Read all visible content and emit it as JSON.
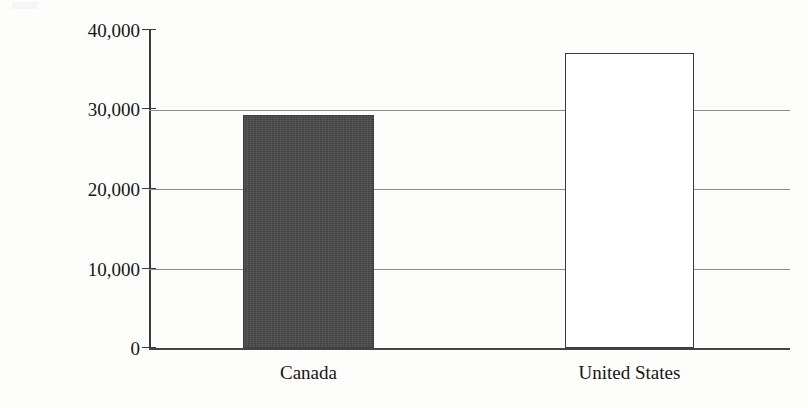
{
  "figure": {
    "background_color": "#fdfdfc",
    "y_axis_title": "income per capita in 1998 C$"
  },
  "chart_data": {
    "type": "bar",
    "title": "",
    "xlabel": "",
    "ylabel": "income per capita in 1998 C$",
    "categories": [
      "Canada",
      "United States"
    ],
    "values": [
      29300,
      37100
    ],
    "ylim": [
      0,
      40000
    ],
    "ytick_values": [
      0,
      10000,
      20000,
      30000,
      40000
    ],
    "ytick_labels": [
      "0",
      "10,000",
      "20,000",
      "30,000",
      "40,000"
    ],
    "grid": true,
    "gridlines_at": [
      10000,
      20000,
      30000
    ],
    "legend": null,
    "series": [
      {
        "name": "income per capita in 1998 C$",
        "values": [
          29300,
          37100
        ],
        "bar_styles": [
          {
            "category": "Canada",
            "fill": "#4a4a4a",
            "border": "#3d3d3d",
            "pattern": "solid-dark-textured"
          },
          {
            "category": "United States",
            "fill": "#ffffff",
            "border": "#3b3b3b",
            "pattern": "outline-only"
          }
        ]
      }
    ]
  },
  "axis": {
    "y_ticks": [
      {
        "label": "40,000",
        "value": 40000
      },
      {
        "label": "30,000",
        "value": 30000
      },
      {
        "label": "20,000",
        "value": 20000
      },
      {
        "label": "10,000",
        "value": 10000
      },
      {
        "label": "0",
        "value": 0
      }
    ]
  },
  "labels": {
    "canada": "Canada",
    "united_states": "United States"
  }
}
